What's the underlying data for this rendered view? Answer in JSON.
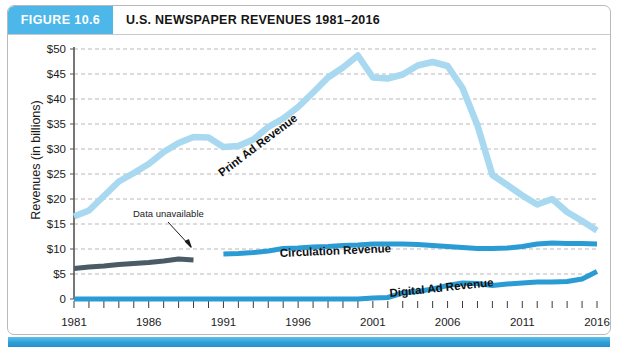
{
  "figure": {
    "badge": "FIGURE 10.6",
    "title": "U.S. NEWSPAPER REVENUES 1981–2016"
  },
  "chart_data": {
    "type": "line",
    "title": "U.S. NEWSPAPER REVENUES 1981–2016",
    "xlabel": "",
    "ylabel": "Revenues (in billions)",
    "ylim": [
      0,
      50
    ],
    "ytick_labels": [
      "$50",
      "$45",
      "$40",
      "$35",
      "$30",
      "$25",
      "$20",
      "$15",
      "$10",
      "$5",
      "0"
    ],
    "ytick_values": [
      50,
      45,
      40,
      35,
      30,
      25,
      20,
      15,
      10,
      5,
      0
    ],
    "xlim": [
      1981,
      2016
    ],
    "xtick_labels": [
      "1981",
      "1986",
      "1991",
      "1996",
      "2001",
      "2006",
      "2011",
      "2016"
    ],
    "xtick_values": [
      1981,
      1986,
      1991,
      1996,
      2001,
      2006,
      2011,
      2016
    ],
    "grid": "horizontal-dashed",
    "legend": "inline-series-labels",
    "annotations": [
      {
        "text": "Data unavailable",
        "x": 1988.5,
        "y": 16.0
      }
    ],
    "series": [
      {
        "name": "Print Ad Revenue",
        "color": "#a9d9f0",
        "x": [
          1981,
          1982,
          1983,
          1984,
          1985,
          1986,
          1987,
          1988,
          1989,
          1990,
          1991,
          1992,
          1993,
          1994,
          1995,
          1996,
          1997,
          1998,
          1999,
          2000,
          2001,
          2002,
          2003,
          2004,
          2005,
          2006,
          2007,
          2008,
          2009,
          2010,
          2011,
          2012,
          2013,
          2014,
          2015,
          2016
        ],
        "values": [
          16.5,
          17.7,
          20.6,
          23.5,
          25.2,
          27.0,
          29.4,
          31.2,
          32.4,
          32.3,
          30.4,
          30.6,
          31.9,
          34.4,
          36.1,
          38.4,
          41.3,
          44.3,
          46.3,
          48.7,
          44.3,
          44.1,
          44.9,
          46.7,
          47.4,
          46.6,
          42.2,
          34.7,
          24.8,
          22.8,
          20.7,
          18.9,
          20.0,
          17.4,
          15.6,
          13.7
        ]
      },
      {
        "name": "Circulation Revenue",
        "color": "#2b9bd4",
        "x": [
          1991,
          1992,
          1993,
          1994,
          1995,
          1996,
          1997,
          1998,
          1999,
          2000,
          2001,
          2002,
          2003,
          2004,
          2005,
          2006,
          2007,
          2008,
          2009,
          2010,
          2011,
          2012,
          2013,
          2014,
          2015,
          2016
        ],
        "values": [
          9.0,
          9.1,
          9.3,
          9.6,
          10.1,
          10.2,
          10.4,
          10.5,
          10.7,
          10.8,
          11.0,
          11.0,
          11.0,
          10.9,
          10.7,
          10.5,
          10.3,
          10.1,
          10.1,
          10.2,
          10.5,
          11.0,
          11.2,
          11.1,
          11.1,
          11.0
        ]
      },
      {
        "name": "Circulation Revenue (early)",
        "color": "#4a5b66",
        "x": [
          1981,
          1982,
          1983,
          1984,
          1985,
          1986,
          1987,
          1988,
          1989
        ],
        "values": [
          6.1,
          6.4,
          6.6,
          6.9,
          7.1,
          7.3,
          7.6,
          8.0,
          7.8
        ]
      },
      {
        "name": "Digital Ad Revenue",
        "color": "#2b9bd4",
        "x": [
          1981,
          1982,
          1983,
          1984,
          1985,
          1986,
          1987,
          1988,
          1989,
          1990,
          1991,
          1992,
          1993,
          1994,
          1995,
          1996,
          1997,
          1998,
          1999,
          2000,
          2001,
          2002,
          2003,
          2004,
          2005,
          2006,
          2007,
          2008,
          2009,
          2010,
          2011,
          2012,
          2013,
          2014,
          2015,
          2016
        ],
        "values": [
          0,
          0,
          0,
          0,
          0,
          0,
          0,
          0,
          0,
          0,
          0,
          0,
          0,
          0,
          0,
          0,
          0,
          0,
          0,
          0,
          0.2,
          0.3,
          1.2,
          1.5,
          2.0,
          2.7,
          3.2,
          3.1,
          2.7,
          3.0,
          3.2,
          3.4,
          3.4,
          3.5,
          4.0,
          5.5
        ]
      }
    ]
  }
}
